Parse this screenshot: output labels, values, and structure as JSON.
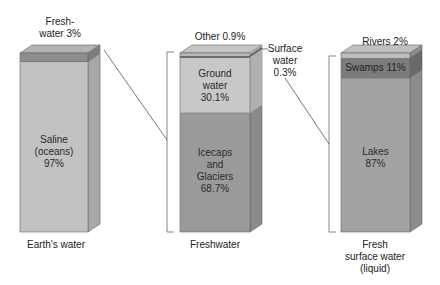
{
  "colors": {
    "saline": "#c2c2c2",
    "freshwater_band": "#8e8e8e",
    "ground_water": "#c8c8c8",
    "icecaps": "#9a9a9a",
    "other": "#b8b8b8",
    "surface_band": "#6e6e6e",
    "rivers": "#bdbdbd",
    "swamps": "#7c7c7c",
    "lakes": "#a3a3a3",
    "line": "#555555"
  },
  "columns": [
    {
      "caption": "Earth's water",
      "top_label_line1": "Fresh-",
      "top_label_line2": "water 3%",
      "segments": [
        {
          "name": "Freshwater",
          "percent": 3
        },
        {
          "name": "Saline (oceans)",
          "line1": "Saline",
          "line2": "(oceans)",
          "line3": "97%",
          "percent": 97
        }
      ]
    },
    {
      "caption": "Freshwater",
      "top_label": "Other 0.9%",
      "side_label_line1": "Surface",
      "side_label_line2": "water",
      "side_label_line3": "0.3%",
      "segments": [
        {
          "name": "Other",
          "percent": 0.9
        },
        {
          "name": "Surface water",
          "percent": 0.3
        },
        {
          "name": "Ground water",
          "line1": "Ground",
          "line2": "water",
          "line3": "30.1%",
          "percent": 30.1
        },
        {
          "name": "Icecaps and Glaciers",
          "line1": "Icecaps",
          "line2": "and",
          "line3": "Glaciers",
          "line4": "68.7%",
          "percent": 68.7
        }
      ]
    },
    {
      "caption_line1": "Fresh",
      "caption_line2": "surface water",
      "caption_line3": "(liquid)",
      "top_label": "Rivers 2%",
      "segments": [
        {
          "name": "Rivers",
          "percent": 2
        },
        {
          "name": "Swamps",
          "label": "Swamps 11%",
          "percent": 11
        },
        {
          "name": "Lakes",
          "line1": "Lakes",
          "line2": "87%",
          "percent": 87
        }
      ]
    }
  ]
}
